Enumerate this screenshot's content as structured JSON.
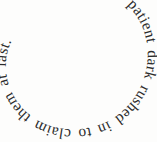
{
  "canvas": {
    "width": 157,
    "height": 142,
    "background_color": "#fdfdfc"
  },
  "artwork": {
    "kind": "spiral-typography",
    "full_text": "the patient dark rushed in to claim them at last.",
    "text_color": "#2b2b2b",
    "font_style": "serif",
    "direction": "clockwise-inward",
    "start_position": "top-right",
    "end_position": "center",
    "turns": 2,
    "segments": [
      {
        "text": "the",
        "position": "top-right",
        "orientation": "rotated-clockwise"
      },
      {
        "text": "patient dark",
        "position": "right-edge",
        "orientation": "reading-downward"
      },
      {
        "text": "rushed in to",
        "position": "bottom",
        "orientation": "upside-down"
      },
      {
        "text": "claim",
        "position": "left-edge",
        "orientation": "reading-upward"
      },
      {
        "text": "them at",
        "position": "inner-top",
        "orientation": "upright-tilted"
      },
      {
        "text": "last.",
        "position": "center",
        "orientation": "reading-downward"
      }
    ]
  }
}
